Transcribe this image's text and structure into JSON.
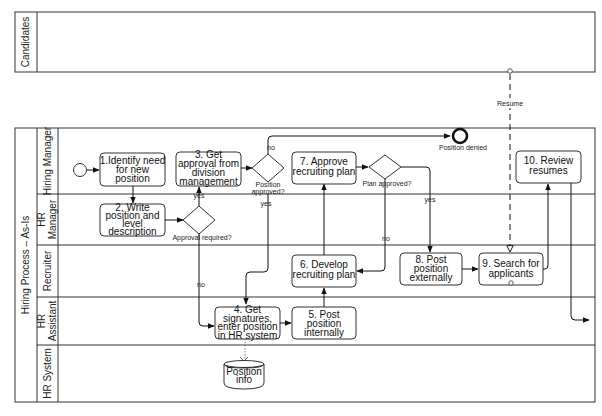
{
  "diagram": {
    "type": "bpmn-swimlane",
    "pools": [
      {
        "id": "candidates",
        "label": "Candidates"
      },
      {
        "id": "main",
        "label": "Hiring Process – As-Is",
        "lanes": [
          {
            "id": "hiring-manager",
            "label": "Hiring Manager"
          },
          {
            "id": "hr-manager",
            "label_line1": "HR",
            "label_line2": "Manager"
          },
          {
            "id": "recruiter",
            "label": "Recruiter"
          },
          {
            "id": "hr-assistant",
            "label_line1": "HR",
            "label_line2": "Assistant"
          },
          {
            "id": "hr-system",
            "label": "HR System"
          }
        ]
      }
    ],
    "tasks": [
      {
        "id": "t1",
        "lines": [
          "1.Identify need",
          "for new",
          "position"
        ]
      },
      {
        "id": "t2",
        "lines": [
          "2. Write",
          "position and",
          "level",
          "description"
        ]
      },
      {
        "id": "t3",
        "lines": [
          "3. Get",
          "approval from",
          "division",
          "management"
        ]
      },
      {
        "id": "t4",
        "lines": [
          "4. Get",
          "signatures,",
          "enter position",
          "in HR system"
        ]
      },
      {
        "id": "t5",
        "lines": [
          "5. Post",
          "position",
          "internally"
        ]
      },
      {
        "id": "t6",
        "lines": [
          "6. Develop",
          "recruiting plan"
        ]
      },
      {
        "id": "t7",
        "lines": [
          "7. Approve",
          "recruiting plan"
        ]
      },
      {
        "id": "t8",
        "lines": [
          "8. Post",
          "position",
          "externally"
        ]
      },
      {
        "id": "t9",
        "lines": [
          "9. Search for",
          "applicants"
        ]
      },
      {
        "id": "t10",
        "lines": [
          "10. Review",
          "resumes"
        ]
      }
    ],
    "gateways": [
      {
        "id": "g1",
        "label": "Approval required?",
        "yes": "yes",
        "no": "no"
      },
      {
        "id": "g2",
        "label_line1": "Position",
        "label_line2": "approved?",
        "yes": "yes",
        "no": "no"
      },
      {
        "id": "g3",
        "label": "Plan approved?",
        "yes": "yes",
        "no": "no"
      }
    ],
    "events": {
      "start": {
        "id": "start"
      },
      "end": {
        "id": "end",
        "label": "Position denied"
      }
    },
    "data_store": {
      "lines": [
        "Position",
        "info"
      ]
    },
    "message_flow": {
      "label": "Resume"
    }
  }
}
